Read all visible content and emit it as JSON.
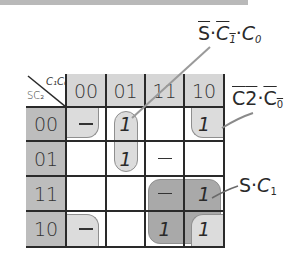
{
  "corner": {
    "col_var": "C₁C₀",
    "row_var": "SC₂"
  },
  "col_labels": [
    "00",
    "01",
    "11",
    "10"
  ],
  "row_labels": [
    "00",
    "01",
    "11",
    "10"
  ],
  "cells": [
    [
      "-",
      "1",
      "",
      "1"
    ],
    [
      "",
      "1",
      "-",
      ""
    ],
    [
      "",
      "",
      "-",
      "1"
    ],
    [
      "-",
      "",
      "1",
      "1"
    ]
  ],
  "groups": [
    {
      "name": "S'·C1'·C0",
      "label": {
        "bar1": "S",
        "dot1": "·",
        "bar2": "C",
        "sub2": "1",
        "dot2": "·",
        "var3": "C",
        "sub3": "0"
      }
    },
    {
      "name": "C2'·C0'",
      "label": {
        "bar1": "C",
        "sub1": "2",
        "dot": "·",
        "bar2": "C",
        "sub2": "0"
      }
    },
    {
      "name": "S·C1",
      "label": {
        "var1": "S",
        "dot": "·",
        "var2": "C",
        "sub2": "1"
      }
    }
  ],
  "colors": {
    "col_header": "#d6d6d6",
    "row_header": "#bdbdbd",
    "group_light": "#dcdcdc",
    "group_dark": "#a9a9a9",
    "grid": "#2a2a2a",
    "leader": "#8a8a8a"
  }
}
